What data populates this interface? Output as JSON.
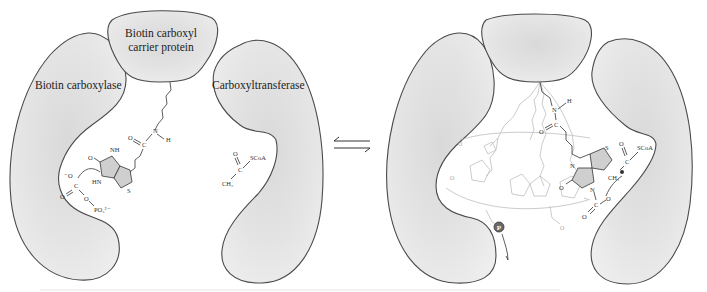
{
  "figure": {
    "left_panel": {
      "labels": {
        "bccp": [
          "Biotin carboxyl",
          "carrier protein"
        ],
        "biotin_carboxylase": "Biotin carboxylase",
        "carboxyltransferase": "Carboxyltransferase"
      },
      "chemistry": {
        "carboxyphosphate": [
          "⁻O",
          "C",
          "O",
          "O",
          "PO₃²⁻"
        ],
        "biotin_ring": [
          "O",
          "NH",
          "HN",
          "S"
        ],
        "amide": [
          "O",
          "C",
          "N",
          "H"
        ],
        "acetyl_coa": [
          "O",
          "CH₃",
          "C",
          "SCoA"
        ]
      }
    },
    "equilibrium_arrow": "⇌",
    "right_panel": {
      "chemistry": {
        "amide": [
          "N",
          "H",
          "C",
          "O"
        ],
        "biotin_ring": [
          "N",
          "S",
          "O"
        ],
        "carboxyl": [
          "O",
          "C",
          "O",
          "⁻"
        ],
        "acetyl_coa": [
          "O",
          "CH₃",
          "C",
          "SCoA"
        ],
        "phosphate_badge": "P"
      }
    },
    "colors": {
      "blob_fill": "#e2e2e2",
      "blob_stroke": "#4a4a4a",
      "ring_fill": "#cfcfcf",
      "faint_structure": "#b5b5b5",
      "background": "#ffffff"
    }
  }
}
